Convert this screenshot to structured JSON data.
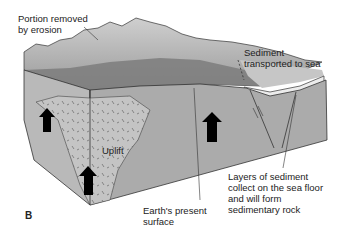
{
  "figure": {
    "panel_label": "B",
    "colors": {
      "front_face": "#b4b4b4",
      "right_face": "#a8a8a8",
      "uplift_zone": "#c2c2c2",
      "eroded_portion": "#d8d8d8",
      "top_surface": "#8a8a8a",
      "sea_surface": "#c8c8c8",
      "sediment_layer": "#eeeeee",
      "outline": "#333333",
      "arrow": "#000000"
    }
  },
  "labels": {
    "erosion": "Portion removed\nby erosion",
    "sediment_transport": "Sediment\ntransported to sea",
    "uplift": "Uplift",
    "present_surface": "Earth's present\nsurface",
    "sedimentary_layers": "Layers of sediment\ncollect on the sea floor\nand will form\nsedimentary rock"
  },
  "arrows": [
    {
      "name": "uplift-arrow-left-upper",
      "direction": "up"
    },
    {
      "name": "uplift-arrow-left-lower",
      "direction": "up"
    },
    {
      "name": "uplift-arrow-right",
      "direction": "up"
    }
  ]
}
